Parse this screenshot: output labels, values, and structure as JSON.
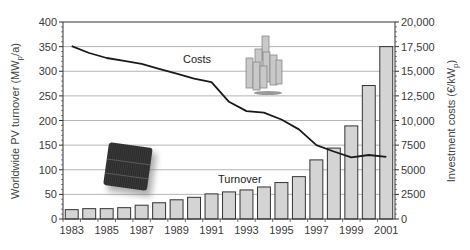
{
  "chart_data": {
    "type": "bar+line",
    "title": "",
    "x": [
      "1983",
      "1984",
      "1985",
      "1986",
      "1987",
      "1988",
      "1989",
      "1990",
      "1991",
      "1992",
      "1993",
      "1994",
      "1995",
      "1996",
      "1997",
      "1998",
      "1999",
      "2000",
      "2001"
    ],
    "x_tick_labels": [
      "1983",
      "1985",
      "1987",
      "1989",
      "1991",
      "1993",
      "1995",
      "1997",
      "1999",
      "2001"
    ],
    "series": [
      {
        "name": "Turnover",
        "type": "bar",
        "axis": "left",
        "unit": "MWp/a",
        "values": [
          19,
          21,
          21,
          23,
          28,
          33,
          39,
          44,
          51,
          55,
          59,
          65,
          74,
          86,
          120,
          144,
          189,
          271,
          350
        ]
      },
      {
        "name": "Costs",
        "type": "line",
        "axis": "right",
        "unit": "€/kWp",
        "values": [
          17550,
          16850,
          16350,
          16050,
          15750,
          15250,
          14750,
          14250,
          13900,
          11900,
          10950,
          10800,
          10100,
          9100,
          7500,
          6850,
          6250,
          6500,
          6300
        ]
      }
    ],
    "ylabel": "Worldwide PV turnover (MWp/a)",
    "ylabel_main": "Worldwide PV turnover (MW",
    "ylabel_sub": "p",
    "ylabel_tail": "/a)",
    "ylim": [
      0,
      400
    ],
    "y_ticks": [
      "0",
      "50",
      "100",
      "150",
      "200",
      "250",
      "300",
      "350",
      "400"
    ],
    "y2label": "Investment costs (€/kWp)",
    "y2label_main": "Investment costs (€/kW",
    "y2label_sub": "p",
    "y2label_tail": ")",
    "y2lim": [
      0,
      20000
    ],
    "y2_ticks": [
      "0",
      "2500",
      "5000",
      "7500",
      "10,000",
      "12,500",
      "15,000",
      "17,500",
      "20,000"
    ],
    "grid": true,
    "legend": "inline labels",
    "annotations": [
      "Costs",
      "Turnover"
    ],
    "images": [
      "solar-cell-photo",
      "solar-module-stack-photo"
    ]
  },
  "colors": {
    "bar_fill": "#d4d4d4",
    "bar_stroke": "#333333",
    "line": "#1a1a1a",
    "grid": "#b5b5b5",
    "axis": "#333333"
  }
}
